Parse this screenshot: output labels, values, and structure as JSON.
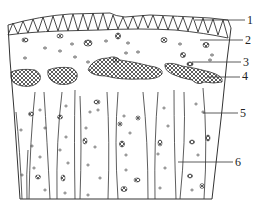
{
  "figure": {
    "type": "cross-section diagram",
    "callouts": [
      {
        "number": "1",
        "x": 247,
        "y": 14
      },
      {
        "number": "2",
        "x": 245,
        "y": 34
      },
      {
        "number": "3",
        "x": 243,
        "y": 56
      },
      {
        "number": "4",
        "x": 242,
        "y": 70
      },
      {
        "number": "5",
        "x": 240,
        "y": 107
      },
      {
        "number": "6",
        "x": 235,
        "y": 156
      }
    ],
    "colors": {
      "line": "#333333",
      "background": "#ffffff"
    }
  }
}
